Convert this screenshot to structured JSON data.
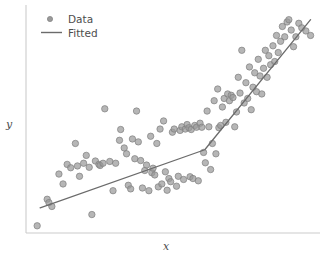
{
  "chart_data": {
    "type": "scatter",
    "title": "",
    "xlabel": "x",
    "ylabel": "y",
    "grid": false,
    "legend_position": "upper left",
    "xlim": [
      0,
      1
    ],
    "ylim": [
      0,
      1
    ],
    "axis_ticks": "none",
    "colors": {
      "marker_fill": "#9a9a9a",
      "marker_edge": "#7f7f7f",
      "line": "#6b6b6b",
      "spine": "#cccccc",
      "text": "#4d4d4d",
      "background": "#ffffff"
    },
    "series": [
      {
        "name": "Data",
        "type": "scatter",
        "marker": "circle",
        "marker_size": 4.2,
        "points": [
          [
            0.038,
            0.032
          ],
          [
            0.072,
            0.15
          ],
          [
            0.078,
            0.135
          ],
          [
            0.088,
            0.118
          ],
          [
            0.112,
            0.262
          ],
          [
            0.126,
            0.218
          ],
          [
            0.14,
            0.305
          ],
          [
            0.152,
            0.29
          ],
          [
            0.168,
            0.398
          ],
          [
            0.175,
            0.298
          ],
          [
            0.182,
            0.252
          ],
          [
            0.196,
            0.31
          ],
          [
            0.205,
            0.345
          ],
          [
            0.215,
            0.292
          ],
          [
            0.224,
            0.082
          ],
          [
            0.236,
            0.32
          ],
          [
            0.248,
            0.305
          ],
          [
            0.252,
            0.3
          ],
          [
            0.262,
            0.31
          ],
          [
            0.268,
            0.552
          ],
          [
            0.285,
            0.318
          ],
          [
            0.296,
            0.188
          ],
          [
            0.305,
            0.31
          ],
          [
            0.318,
            0.412
          ],
          [
            0.322,
            0.46
          ],
          [
            0.334,
            0.378
          ],
          [
            0.342,
            0.352
          ],
          [
            0.348,
            0.212
          ],
          [
            0.356,
            0.196
          ],
          [
            0.362,
            0.418
          ],
          [
            0.37,
            0.33
          ],
          [
            0.376,
            0.542
          ],
          [
            0.382,
            0.405
          ],
          [
            0.39,
            0.322
          ],
          [
            0.396,
            0.2
          ],
          [
            0.404,
            0.278
          ],
          [
            0.41,
            0.302
          ],
          [
            0.418,
            0.188
          ],
          [
            0.424,
            0.43
          ],
          [
            0.428,
            0.268
          ],
          [
            0.432,
            0.288
          ],
          [
            0.438,
            0.258
          ],
          [
            0.445,
            0.398
          ],
          [
            0.45,
            0.205
          ],
          [
            0.456,
            0.462
          ],
          [
            0.462,
            0.218
          ],
          [
            0.468,
            0.498
          ],
          [
            0.474,
            0.272
          ],
          [
            0.48,
            0.19
          ],
          [
            0.486,
            0.242
          ],
          [
            0.492,
            0.228
          ],
          [
            0.498,
            0.448
          ],
          [
            0.504,
            0.462
          ],
          [
            0.512,
            0.208
          ],
          [
            0.518,
            0.252
          ],
          [
            0.524,
            0.456
          ],
          [
            0.53,
            0.472
          ],
          [
            0.536,
            0.238
          ],
          [
            0.542,
            0.462
          ],
          [
            0.548,
            0.482
          ],
          [
            0.554,
            0.468
          ],
          [
            0.558,
            0.25
          ],
          [
            0.562,
            0.46
          ],
          [
            0.568,
            0.242
          ],
          [
            0.574,
            0.478
          ],
          [
            0.58,
            0.47
          ],
          [
            0.586,
            0.232
          ],
          [
            0.592,
            0.488
          ],
          [
            0.598,
            0.47
          ],
          [
            0.604,
            0.358
          ],
          [
            0.61,
            0.312
          ],
          [
            0.616,
            0.542
          ],
          [
            0.622,
            0.472
          ],
          [
            0.628,
            0.282
          ],
          [
            0.634,
            0.398
          ],
          [
            0.64,
            0.588
          ],
          [
            0.646,
            0.352
          ],
          [
            0.652,
            0.64
          ],
          [
            0.656,
            0.468
          ],
          [
            0.662,
            0.478
          ],
          [
            0.668,
            0.56
          ],
          [
            0.674,
            0.598
          ],
          [
            0.68,
            0.492
          ],
          [
            0.686,
            0.618
          ],
          [
            0.692,
            0.588
          ],
          [
            0.698,
            0.612
          ],
          [
            0.704,
            0.602
          ],
          [
            0.71,
            0.472
          ],
          [
            0.716,
            0.538
          ],
          [
            0.722,
            0.692
          ],
          [
            0.728,
            0.622
          ],
          [
            0.734,
            0.812
          ],
          [
            0.742,
            0.578
          ],
          [
            0.748,
            0.668
          ],
          [
            0.754,
            0.598
          ],
          [
            0.76,
            0.738
          ],
          [
            0.766,
            0.548
          ],
          [
            0.772,
            0.648
          ],
          [
            0.778,
            0.712
          ],
          [
            0.784,
            0.628
          ],
          [
            0.79,
            0.772
          ],
          [
            0.796,
            0.698
          ],
          [
            0.802,
            0.618
          ],
          [
            0.808,
            0.732
          ],
          [
            0.814,
            0.812
          ],
          [
            0.82,
            0.692
          ],
          [
            0.826,
            0.788
          ],
          [
            0.832,
            0.748
          ],
          [
            0.84,
            0.832
          ],
          [
            0.846,
            0.762
          ],
          [
            0.852,
            0.878
          ],
          [
            0.858,
            0.802
          ],
          [
            0.866,
            0.852
          ],
          [
            0.872,
            0.918
          ],
          [
            0.88,
            0.872
          ],
          [
            0.888,
            0.938
          ],
          [
            0.894,
            0.948
          ],
          [
            0.902,
            0.902
          ],
          [
            0.91,
            0.828
          ],
          [
            0.918,
            0.872
          ],
          [
            0.928,
            0.932
          ],
          [
            0.938,
            0.912
          ],
          [
            0.952,
            0.898
          ],
          [
            0.968,
            0.878
          ]
        ]
      },
      {
        "name": "Fitted",
        "type": "line",
        "linewidth": 1.3,
        "knee_x": 0.608,
        "points": [
          [
            0.048,
            0.112
          ],
          [
            0.608,
            0.37
          ],
          [
            0.968,
            0.948
          ]
        ]
      }
    ],
    "legend_entries": [
      {
        "label": "Data",
        "marker": "circle"
      },
      {
        "label": "Fitted",
        "marker": "line"
      }
    ]
  },
  "axes": {
    "ylabel": "y",
    "xlabel": "x"
  },
  "legend": {
    "data_label": "Data",
    "fitted_label": "Fitted"
  }
}
